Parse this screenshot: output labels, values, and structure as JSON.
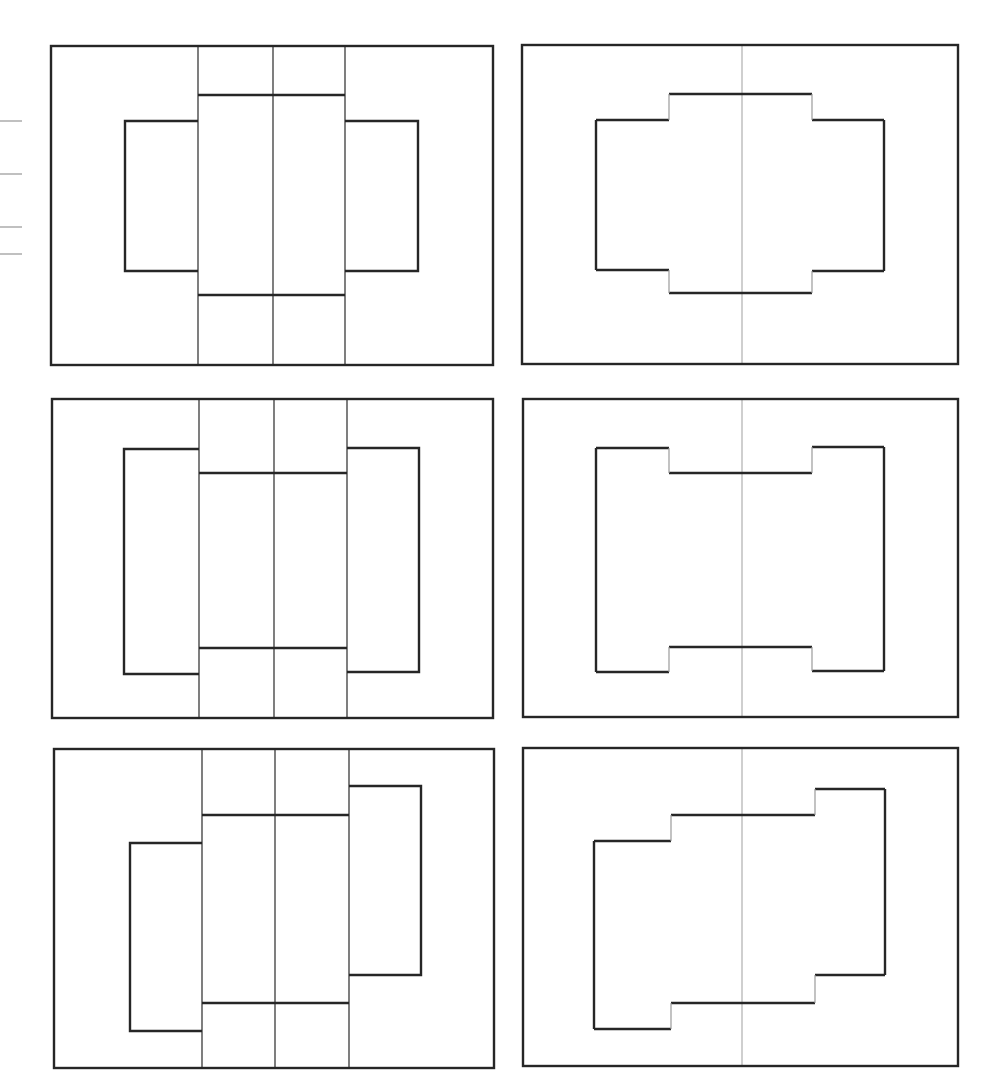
{
  "figure": {
    "colors": {
      "stroke": "#262626",
      "thin_stroke": "#3a3a3a",
      "axis_gray": "#a8a8a8",
      "tick_gray": "#8c8c8c",
      "background": "#ffffff"
    },
    "ticks": [
      {
        "x1": 0,
        "x2": 22,
        "y": 121
      },
      {
        "x1": 0,
        "x2": 22,
        "y": 174
      },
      {
        "x1": 0,
        "x2": 22,
        "y": 227
      },
      {
        "x1": 0,
        "x2": 22,
        "y": 254
      }
    ],
    "left_panels": [
      {
        "name": "top-left-panel",
        "outer": {
          "x": 51,
          "y": 46,
          "w": 442,
          "h": 319
        },
        "dividers_x": [
          198,
          273,
          345
        ],
        "center_block": {
          "top": 95,
          "bottom": 295
        },
        "left_rect": {
          "x": 125,
          "y": 121,
          "right": 198,
          "bottom": 271
        },
        "right_rect": {
          "x": 345,
          "y": 121,
          "right": 418,
          "bottom": 271
        }
      },
      {
        "name": "middle-left-panel",
        "outer": {
          "x": 52,
          "y": 399,
          "w": 441,
          "h": 319
        },
        "dividers_x": [
          199,
          274,
          347
        ],
        "center_block": {
          "top": 473,
          "bottom": 648
        },
        "left_rect": {
          "x": 124,
          "y": 449,
          "right": 199,
          "bottom": 674
        },
        "right_rect": {
          "x": 347,
          "y": 448,
          "right": 419,
          "bottom": 672
        }
      },
      {
        "name": "bottom-left-panel",
        "outer": {
          "x": 54,
          "y": 749,
          "w": 440,
          "h": 319
        },
        "dividers_x": [
          202,
          275,
          349
        ],
        "center_block": {
          "top": 815,
          "bottom": 1003
        },
        "left_rect": {
          "x": 130,
          "y": 843,
          "right": 202,
          "bottom": 1031
        },
        "right_rect": {
          "x": 349,
          "y": 786,
          "right": 421,
          "bottom": 975
        }
      }
    ],
    "right_panels": [
      {
        "name": "top-right-panel",
        "outer": {
          "x": 522,
          "y": 45,
          "w": 436,
          "h": 319
        },
        "center_x": 742,
        "outline": {
          "left": 596,
          "right": 884,
          "step_left_x": 669,
          "step_right_x": 812,
          "left_top": 120,
          "mid_top": 94,
          "right_top": 120,
          "left_bottom": 270,
          "mid_bottom": 293,
          "right_bottom": 271
        }
      },
      {
        "name": "middle-right-panel",
        "outer": {
          "x": 523,
          "y": 399,
          "w": 435,
          "h": 318
        },
        "center_x": 742,
        "outline": {
          "left": 596,
          "right": 884,
          "step_left_x": 669,
          "step_right_x": 812,
          "left_top": 448,
          "mid_top": 473,
          "right_top": 447,
          "left_bottom": 672,
          "mid_bottom": 647,
          "right_bottom": 671
        }
      },
      {
        "name": "bottom-right-panel",
        "outer": {
          "x": 523,
          "y": 748,
          "w": 435,
          "h": 318
        },
        "center_x": 742,
        "outline": {
          "left": 594,
          "right": 885,
          "step_left_x": 671,
          "step_right_x": 815,
          "left_top": 841,
          "mid_top": 815,
          "right_top": 789,
          "left_bottom": 1029,
          "mid_bottom": 1003,
          "right_bottom": 975
        }
      }
    ]
  }
}
